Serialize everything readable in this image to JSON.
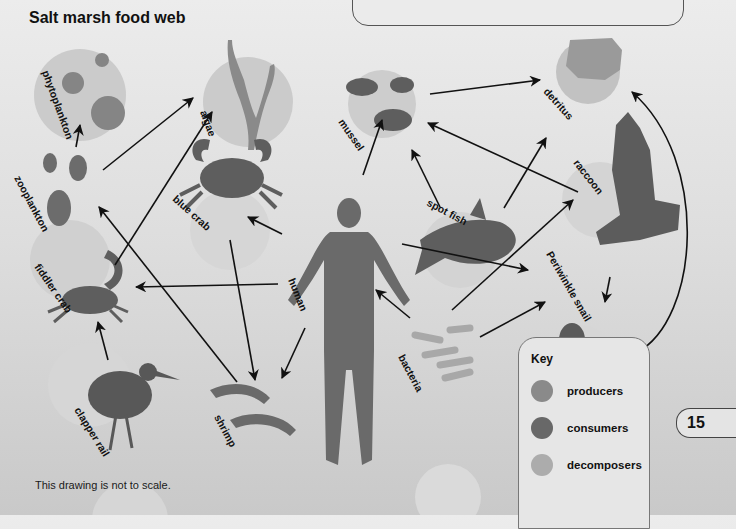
{
  "title": "Salt marsh food web",
  "note": "This drawing is not to scale.",
  "page_number": "15",
  "colors": {
    "background": "#dcdcdc",
    "producer": "#8a8a8a",
    "consumer": "#6a6a6a",
    "decomposer": "#aaaaaa",
    "circle_bg": "#cfcfcf",
    "arrow": "#111111"
  },
  "key": {
    "title": "Key",
    "items": [
      {
        "label": "producers",
        "color": "#8a8a8a"
      },
      {
        "label": "consumers",
        "color": "#686868"
      },
      {
        "label": "decomposers",
        "color": "#acacac"
      }
    ]
  },
  "organisms": [
    {
      "id": "phytoplankton",
      "label": "phytoplankton",
      "role": "producer",
      "icon": "plankton-icon"
    },
    {
      "id": "algae",
      "label": "algae",
      "role": "producer",
      "icon": "seaweed-icon"
    },
    {
      "id": "mussel",
      "label": "mussel",
      "role": "consumer",
      "icon": "mussel-icon"
    },
    {
      "id": "detritus",
      "label": "detritus",
      "role": "decomposer",
      "icon": "detritus-icon"
    },
    {
      "id": "zooplankton",
      "label": "zooplankton",
      "role": "consumer",
      "icon": "zooplankton-icon"
    },
    {
      "id": "blue_crab",
      "label": "blue crab",
      "role": "consumer",
      "icon": "crab-icon"
    },
    {
      "id": "human",
      "label": "human",
      "role": "consumer",
      "icon": "human-icon"
    },
    {
      "id": "spot_fish",
      "label": "spot fish",
      "role": "consumer",
      "icon": "fish-icon"
    },
    {
      "id": "raccoon",
      "label": "raccoon",
      "role": "consumer",
      "icon": "raccoon-icon"
    },
    {
      "id": "fiddler_crab",
      "label": "fiddler crab",
      "role": "consumer",
      "icon": "fiddler-crab-icon"
    },
    {
      "id": "periwinkle_snail",
      "label": "Periwinkle snail",
      "role": "consumer",
      "icon": "snail-icon"
    },
    {
      "id": "clapper_rail",
      "label": "clapper rail",
      "role": "consumer",
      "icon": "bird-icon"
    },
    {
      "id": "shrimp",
      "label": "shrimp",
      "role": "consumer",
      "icon": "shrimp-icon"
    },
    {
      "id": "bacteria",
      "label": "bacteria",
      "role": "decomposer",
      "icon": "bacteria-icon"
    }
  ],
  "arrows": [
    {
      "from": "zooplankton",
      "to": "phytoplankton"
    },
    {
      "from": "zooplankton",
      "to": "algae"
    },
    {
      "from": "fiddler_crab",
      "to": "algae"
    },
    {
      "from": "shrimp",
      "to": "zooplankton"
    },
    {
      "from": "blue_crab",
      "to": "shrimp"
    },
    {
      "from": "human",
      "to": "blue_crab"
    },
    {
      "from": "human",
      "to": "fiddler_crab"
    },
    {
      "from": "human",
      "to": "shrimp"
    },
    {
      "from": "human",
      "to": "mussel"
    },
    {
      "from": "human",
      "to": "periwinkle_snail"
    },
    {
      "from": "clapper_rail",
      "to": "fiddler_crab"
    },
    {
      "from": "mussel",
      "to": "detritus"
    },
    {
      "from": "spot_fish",
      "to": "mussel"
    },
    {
      "from": "spot_fish",
      "to": "detritus"
    },
    {
      "from": "raccoon",
      "to": "mussel"
    },
    {
      "from": "raccoon",
      "to": "periwinkle_snail"
    },
    {
      "from": "periwinkle_snail",
      "to": "detritus"
    },
    {
      "from": "bacteria",
      "to": "human"
    },
    {
      "from": "bacteria",
      "to": "raccoon"
    },
    {
      "from": "bacteria",
      "to": "periwinkle_snail"
    }
  ]
}
